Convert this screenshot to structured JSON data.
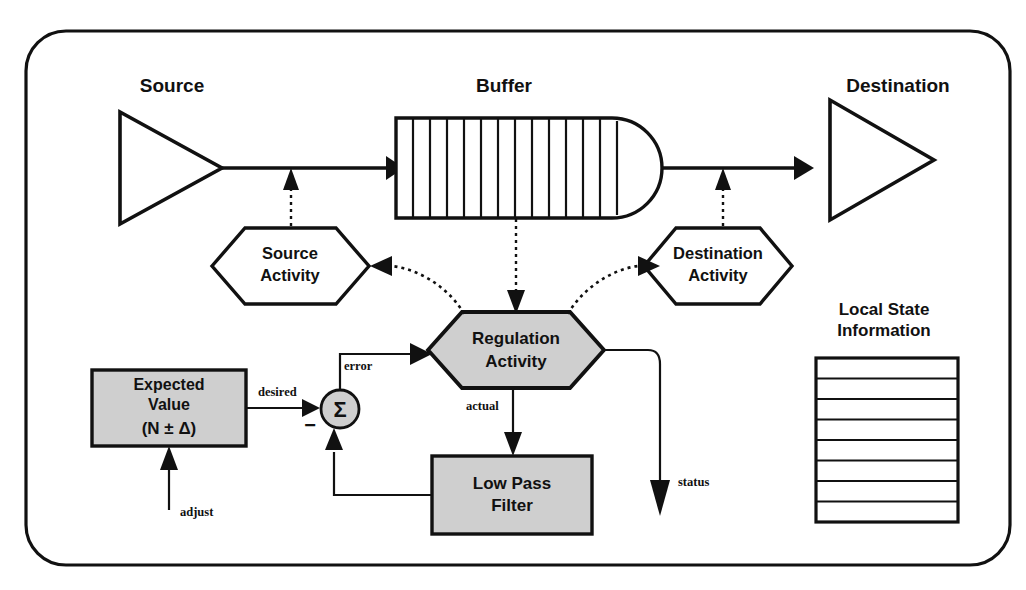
{
  "diagram": {
    "title_region": "flow-control-regulation-diagram",
    "colors": {
      "ink": "#111111",
      "shaded_fill": "#cfcfcf",
      "plain_fill": "#ffffff",
      "background": "#ffffff"
    },
    "frame": {
      "name": "outer-rounded-frame",
      "corner_radius": 40
    },
    "nodes": {
      "source": {
        "label": "Source",
        "shape": "triangle-right",
        "fill": "#ffffff"
      },
      "buffer": {
        "label": "Buffer",
        "shape": "queue-rounded-right",
        "fill": "#ffffff",
        "cell_count": 13
      },
      "destination": {
        "label": "Destination",
        "shape": "triangle-right",
        "fill": "#ffffff"
      },
      "source_activity": {
        "label_line1": "Source",
        "label_line2": "Activity",
        "shape": "hexagon",
        "fill": "#ffffff"
      },
      "destination_activity": {
        "label_line1": "Destination",
        "label_line2": "Activity",
        "shape": "hexagon",
        "fill": "#ffffff"
      },
      "regulation_activity": {
        "label_line1": "Regulation",
        "label_line2": "Activity",
        "shape": "hexagon",
        "fill": "#cfcfcf"
      },
      "expected_value": {
        "label_line1": "Expected",
        "label_line2": "Value",
        "label_line3": "(N ± Δ)",
        "shape": "rectangle",
        "fill": "#cfcfcf"
      },
      "low_pass_filter": {
        "label_line1": "Low Pass",
        "label_line2": "Filter",
        "shape": "rectangle",
        "fill": "#cfcfcf"
      },
      "summation": {
        "label": "Σ",
        "shape": "circle",
        "fill": "#cfcfcf",
        "sign": "−"
      },
      "local_state": {
        "label_line1": "Local State",
        "label_line2": "Information",
        "shape": "table",
        "row_count": 8,
        "fill": "#ffffff"
      }
    },
    "edge_labels": {
      "desired": "desired",
      "error": "error",
      "actual": "actual",
      "adjust": "adjust",
      "status": "status"
    },
    "edges": [
      {
        "name": "source-to-buffer",
        "style": "solid",
        "from": "source",
        "to": "buffer"
      },
      {
        "name": "buffer-to-destination",
        "style": "solid",
        "from": "buffer",
        "to": "destination"
      },
      {
        "name": "source-activity-to-source-flow",
        "style": "dotted",
        "from": "source_activity",
        "to": "source-to-buffer"
      },
      {
        "name": "destination-activity-to-destination-flow",
        "style": "dotted",
        "from": "destination_activity",
        "to": "buffer-to-destination"
      },
      {
        "name": "buffer-to-regulation",
        "style": "dotted",
        "from": "buffer",
        "to": "regulation_activity"
      },
      {
        "name": "regulation-to-source-activity",
        "style": "dotted-curve",
        "from": "regulation_activity",
        "to": "source_activity"
      },
      {
        "name": "regulation-to-destination-activity",
        "style": "dotted-curve",
        "from": "regulation_activity",
        "to": "destination_activity"
      },
      {
        "name": "expected-value-to-sum",
        "style": "solid",
        "label": "desired"
      },
      {
        "name": "sum-to-regulation",
        "style": "solid",
        "label": "error"
      },
      {
        "name": "regulation-to-low-pass-filter",
        "style": "solid",
        "label": "actual"
      },
      {
        "name": "low-pass-filter-to-sum",
        "style": "solid"
      },
      {
        "name": "adjust-to-expected-value",
        "style": "solid",
        "label": "adjust"
      },
      {
        "name": "regulation-status-out",
        "style": "solid",
        "label": "status"
      }
    ]
  }
}
